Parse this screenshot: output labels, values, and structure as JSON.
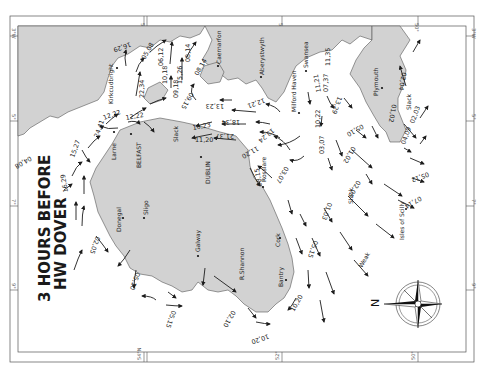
{
  "title": {
    "line1": "3 HOURS BEFORE",
    "line2": "HW DOVER"
  },
  "colors": {
    "land": "#d2d2d2",
    "sea": "#ffffff",
    "border": "#555555",
    "ink": "#1c1c1c"
  },
  "border": {
    "top_labels": [
      "54°N",
      "52°",
      "50°",
      "3°W"
    ],
    "bottom_labels": [
      "54°N",
      "52°",
      "50°"
    ],
    "left_labels": [
      "3°W",
      "5°",
      "7°",
      "9°"
    ],
    "right_labels": [
      "3°W",
      "5°",
      "7°",
      "9°"
    ]
  },
  "places": [
    {
      "name": "Kirkcudbright"
    },
    {
      "name": "Larne"
    },
    {
      "name": "BELFAST"
    },
    {
      "name": "DUBLIN"
    },
    {
      "name": "Caernarfon"
    },
    {
      "name": "Aberystwyth"
    },
    {
      "name": "Milford Haven"
    },
    {
      "name": "Swansea"
    },
    {
      "name": "Plymouth"
    },
    {
      "name": "Rosslare"
    },
    {
      "name": "Cork"
    },
    {
      "name": "Bantry"
    },
    {
      "name": "R.Shannon"
    },
    {
      "name": "Galway"
    },
    {
      "name": "Sligo"
    },
    {
      "name": "Donegal"
    },
    {
      "name": "Isles of Scilly"
    }
  ],
  "annotations": {
    "slack_labels": [
      "Slack",
      "Slack",
      "Slack"
    ],
    "weak_label": "Weak",
    "compass_north": "N"
  },
  "tidal_rates": [
    "16,29",
    "05,08",
    "06,12",
    "08,14",
    "10,18",
    "15,26",
    "08,14",
    "22,34",
    "09,18",
    "09,15",
    "13,23",
    "12,22",
    "12,22",
    "24,41",
    "15,27",
    "04,08",
    "16,29",
    "10,23",
    "18,34",
    "11,20",
    "21,37",
    "12,21",
    "13,24",
    "11,20",
    "03,07",
    "08,15",
    "10,22",
    "03,07",
    "11,21",
    "07,37",
    "11,35",
    "13,29",
    "01,02",
    "02,04",
    "02,03",
    "04,09",
    "05,10",
    "01,02",
    "02,05",
    "01,03",
    "05,12",
    "07,14",
    "05,15",
    "10,20",
    "10,20",
    "02,10",
    "05,15",
    "05,10",
    "02,05"
  ]
}
